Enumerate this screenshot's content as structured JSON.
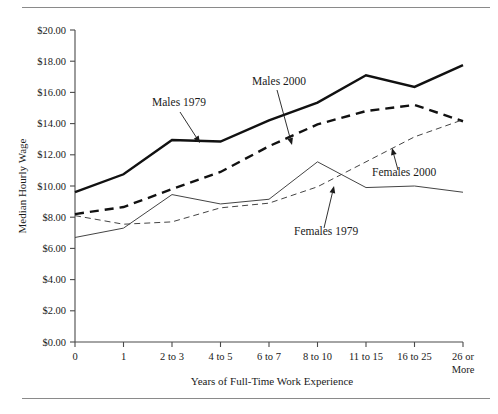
{
  "figure": {
    "background": "#ffffff",
    "line_color": "#111111",
    "rule_color": "#8a8a8a"
  },
  "chart_data": {
    "type": "line",
    "title": "",
    "subtitle": "",
    "xlabel": "Years of Full-Time Work Experience",
    "ylabel": "Median Hourly Wage",
    "grid": false,
    "legend_position": "inline-annotations",
    "categories": [
      "0",
      "1",
      "2 to 3",
      "4 to 5",
      "6 to 7",
      "8 to 10",
      "11 to 15",
      "16 to 25",
      "26 or More"
    ],
    "x_tick_labels": [
      "0",
      "1",
      "2 to 3",
      "4 to 5",
      "6 to 7",
      "8 to 10",
      "11 to 15",
      "16 to 25",
      "26 or\nMore"
    ],
    "y_tick_labels": [
      "$0.00",
      "$2.00",
      "$4.00",
      "$6.00",
      "$8.00",
      "$10.00",
      "$12.00",
      "$14.00",
      "$16.00",
      "$18.00",
      "$20.00"
    ],
    "y_tick_values": [
      0,
      2,
      4,
      6,
      8,
      10,
      12,
      14,
      16,
      18,
      20
    ],
    "ylim": [
      0,
      20
    ],
    "y_prefix": "$",
    "series": [
      {
        "name": "Males 1979",
        "style": "thick-solid",
        "values": [
          9.6,
          10.75,
          12.95,
          12.85,
          14.2,
          15.35,
          17.1,
          16.35,
          17.75
        ]
      },
      {
        "name": "Males 2000",
        "style": "thick-dashed",
        "values": [
          8.2,
          8.65,
          9.8,
          10.9,
          12.55,
          13.95,
          14.8,
          15.2,
          14.15
        ]
      },
      {
        "name": "Females 1979",
        "style": "thin-solid",
        "values": [
          6.7,
          7.3,
          9.45,
          8.85,
          9.15,
          11.55,
          9.9,
          10.0,
          9.6
        ]
      },
      {
        "name": "Females 2000",
        "style": "thin-dashed",
        "values": [
          8.1,
          7.55,
          7.7,
          8.6,
          8.9,
          9.95,
          11.55,
          13.15,
          14.25
        ]
      }
    ],
    "annotations": [
      {
        "label": "Males 1979",
        "text_x": 152,
        "text_y": 106,
        "leader_from_x": 180,
        "leader_from_y": 112,
        "leader_to_x": 200,
        "leader_to_y": 143,
        "series": "Males 1979"
      },
      {
        "label": "Males 2000",
        "text_x": 252,
        "text_y": 85,
        "leader_from_x": 277,
        "leader_from_y": 90,
        "leader_to_x": 292,
        "leader_to_y": 145,
        "series": "Males 2000"
      },
      {
        "label": "Females 2000",
        "text_x": 372,
        "text_y": 176,
        "leader_from_x": 398,
        "leader_from_y": 170,
        "leader_to_x": 392,
        "leader_to_y": 148,
        "series": "Females 2000"
      },
      {
        "label": "Females 1979",
        "text_x": 294,
        "text_y": 235,
        "leader_from_x": 324,
        "leader_from_y": 228,
        "leader_to_x": 334,
        "leader_to_y": 186,
        "series": "Females 1979"
      }
    ]
  }
}
